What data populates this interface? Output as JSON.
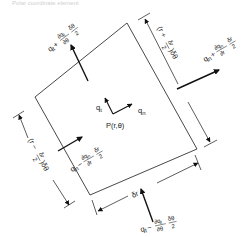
{
  "figure": {
    "caption": "Polar coordinate element",
    "colors": {
      "line": "#333333",
      "arrow": "#111111",
      "text": "#222222"
    }
  },
  "labels": {
    "point": "P(r,θ)",
    "q_t": "q",
    "q_t_sub": "t",
    "q_n": "q",
    "q_n_sub": "n",
    "top_flux": {
      "base": "q",
      "base_sub": "t",
      "sign": "+",
      "num": "∂q",
      "num_sub": "t",
      "den": "∂θ",
      "factor_num": "δθ",
      "factor_den": "2"
    },
    "bottom_flux": {
      "base": "q",
      "base_sub": "t",
      "sign": "−",
      "num": "∂q",
      "num_sub": "t",
      "den": "∂θ",
      "factor_num": "δθ",
      "factor_den": "2"
    },
    "right_flux": {
      "base": "q",
      "base_sub": "n",
      "sign": "+",
      "num": "∂q",
      "num_sub": "n",
      "den": "∂r",
      "factor_num": "δr",
      "factor_den": "2"
    },
    "left_flux": {
      "base": "q",
      "base_sub": "n",
      "sign": "−",
      "num": "∂q",
      "num_sub": "n",
      "den": "∂r",
      "factor_num": "δr",
      "factor_den": "2"
    },
    "right_dim": {
      "open": "(r +",
      "num": "δr",
      "den": "2",
      "close": ")δθ"
    },
    "left_dim": {
      "open": "(r −",
      "num": "δr",
      "den": "2",
      "close": ")δθ"
    },
    "bottom_dim": "δr"
  }
}
